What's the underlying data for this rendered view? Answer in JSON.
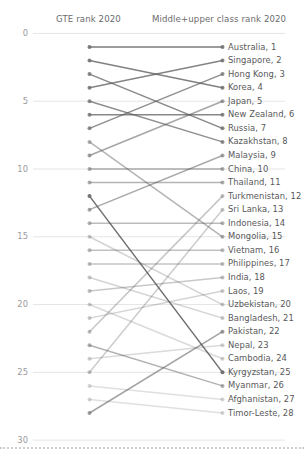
{
  "header": {
    "left_title": "GTE rank 2020",
    "right_title": "Middle+upper class rank 2020"
  },
  "axis": {
    "yticks": [
      "0",
      "5",
      "10",
      "15",
      "20",
      "25",
      "30"
    ],
    "ytick_values": [
      0,
      5,
      10,
      15,
      20,
      25,
      30
    ],
    "ymin": 0,
    "ymax": 30
  },
  "chart_data": {
    "type": "line",
    "subtype": "slopegraph",
    "title": "",
    "xlabel": "",
    "ylabel": "",
    "ylim": [
      0,
      30
    ],
    "grid": true,
    "legend": "none",
    "axes": [
      "GTE rank 2020",
      "Middle+upper class rank 2020"
    ],
    "categories": [
      "GTE rank 2020",
      "Middle+upper class rank 2020"
    ],
    "right_labels": [
      "Australia, 1",
      "Singapore, 2",
      "Hong Kong, 3",
      "Korea, 4",
      "Japan, 5",
      "New Zealand, 6",
      "Russia, 7",
      "Kazakhstan, 8",
      "Malaysia, 9",
      "China, 10",
      "Thailand, 11",
      "Turkmenistan, 12",
      "Sri Lanka, 13",
      "Indonesia, 14",
      "Mongolia, 15",
      "Vietnam, 16",
      "Philippines, 17",
      "India, 18",
      "Laos, 19",
      "Uzbekistan, 20",
      "Bangladesh, 21",
      "Pakistan, 22",
      "Nepal, 23",
      "Cambodia, 24",
      "Kyrgyzstan, 25",
      "Myanmar, 26",
      "Afghanistan, 27",
      "Timor-Leste, 28"
    ],
    "series": [
      {
        "name": "Australia",
        "gte_rank": 1,
        "class_rank": 1,
        "shade": 0.78
      },
      {
        "name": "Singapore",
        "gte_rank": 4,
        "class_rank": 2,
        "shade": 0.72
      },
      {
        "name": "Hong Kong",
        "gte_rank": 7,
        "class_rank": 3,
        "shade": 0.66
      },
      {
        "name": "Korea",
        "gte_rank": 2,
        "class_rank": 4,
        "shade": 0.74
      },
      {
        "name": "Japan",
        "gte_rank": 9,
        "class_rank": 5,
        "shade": 0.52
      },
      {
        "name": "New Zealand",
        "gte_rank": 6,
        "class_rank": 6,
        "shade": 0.7
      },
      {
        "name": "Russia",
        "gte_rank": 3,
        "class_rank": 7,
        "shade": 0.7
      },
      {
        "name": "Kazakhstan",
        "gte_rank": 5,
        "class_rank": 8,
        "shade": 0.66
      },
      {
        "name": "Malaysia",
        "gte_rank": 13,
        "class_rank": 9,
        "shade": 0.5
      },
      {
        "name": "China",
        "gte_rank": 10,
        "class_rank": 10,
        "shade": 0.46
      },
      {
        "name": "Thailand",
        "gte_rank": 11,
        "class_rank": 11,
        "shade": 0.44
      },
      {
        "name": "Turkmenistan",
        "gte_rank": 22,
        "class_rank": 12,
        "shade": 0.34
      },
      {
        "name": "Sri Lanka",
        "gte_rank": 25,
        "class_rank": 13,
        "shade": 0.3
      },
      {
        "name": "Indonesia",
        "gte_rank": 14,
        "class_rank": 14,
        "shade": 0.4
      },
      {
        "name": "Mongolia",
        "gte_rank": 8,
        "class_rank": 15,
        "shade": 0.44
      },
      {
        "name": "Vietnam",
        "gte_rank": 16,
        "class_rank": 16,
        "shade": 0.36
      },
      {
        "name": "Philippines",
        "gte_rank": 17,
        "class_rank": 17,
        "shade": 0.34
      },
      {
        "name": "India",
        "gte_rank": 19,
        "class_rank": 18,
        "shade": 0.32
      },
      {
        "name": "Laos",
        "gte_rank": 21,
        "class_rank": 19,
        "shade": 0.26
      },
      {
        "name": "Uzbekistan",
        "gte_rank": 15,
        "class_rank": 20,
        "shade": 0.26
      },
      {
        "name": "Bangladesh",
        "gte_rank": 18,
        "class_rank": 21,
        "shade": 0.26
      },
      {
        "name": "Pakistan",
        "gte_rank": 28,
        "class_rank": 22,
        "shade": 0.55
      },
      {
        "name": "Nepal",
        "gte_rank": 24,
        "class_rank": 23,
        "shade": 0.22
      },
      {
        "name": "Cambodia",
        "gte_rank": 20,
        "class_rank": 24,
        "shade": 0.22
      },
      {
        "name": "Kyrgyzstan",
        "gte_rank": 12,
        "class_rank": 25,
        "shade": 0.85
      },
      {
        "name": "Myanmar",
        "gte_rank": 23,
        "class_rank": 26,
        "shade": 0.45
      },
      {
        "name": "Afghanistan",
        "gte_rank": 26,
        "class_rank": 27,
        "shade": 0.18
      },
      {
        "name": "Timor-Leste",
        "gte_rank": 27,
        "class_rank": 28,
        "shade": 0.18
      }
    ]
  },
  "colors": {
    "line": "#555557",
    "gridline": "#e2e2e2",
    "dot": "#6e6e70",
    "text": "#58585a",
    "tick_text": "#9a9a9c"
  }
}
